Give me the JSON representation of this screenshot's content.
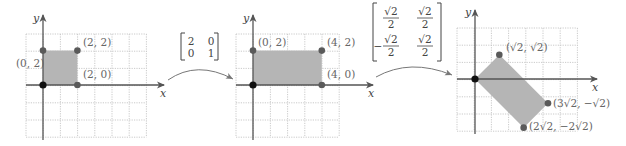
{
  "colors": {
    "grid": "#c4c4c4",
    "axis": "#555555",
    "fill": "#b5b5b5",
    "point": "#5a5a5a",
    "origin": "#111111",
    "arrow": "#777777",
    "text": "#666666"
  },
  "panels": [
    {
      "name": "original-square",
      "grid": {
        "left": 26,
        "top": 34,
        "cols": 7,
        "rows": 6,
        "cell": 17.2
      },
      "origin": [
        43,
        85
      ],
      "x_axis": {
        "from": 26,
        "to": 164,
        "label": "x",
        "label_pos": [
          160,
          97
        ]
      },
      "y_axis": {
        "from": 140,
        "to": 15,
        "label": "y",
        "label_pos": [
          33,
          22
        ]
      },
      "polygon": [
        [
          0,
          0
        ],
        [
          2,
          0
        ],
        [
          2,
          2
        ],
        [
          0,
          2
        ]
      ],
      "unit": 17.2,
      "points": [
        {
          "xy": [
            0,
            0
          ],
          "origin": true
        },
        {
          "xy": [
            2,
            0
          ],
          "label": "(2, 0)",
          "label_pos": [
            83,
            78
          ]
        },
        {
          "xy": [
            2,
            2
          ],
          "label": "(2, 2)",
          "label_pos": [
            83,
            46
          ]
        },
        {
          "xy": [
            0,
            2
          ],
          "label": "(0, 2)",
          "label_pos": [
            16,
            67
          ]
        }
      ]
    },
    {
      "name": "stretched-rectangle",
      "grid": {
        "left": 236,
        "top": 34,
        "cols": 6,
        "rows": 6,
        "cell": 17.2
      },
      "origin": [
        253,
        85
      ],
      "x_axis": {
        "from": 236,
        "to": 373,
        "label": "x",
        "label_pos": [
          368,
          97
        ]
      },
      "y_axis": {
        "from": 140,
        "to": 15,
        "label": "y",
        "label_pos": [
          243,
          22
        ]
      },
      "polygon": [
        [
          0,
          0
        ],
        [
          4,
          0
        ],
        [
          4,
          2
        ],
        [
          0,
          2
        ]
      ],
      "unit": 17.2,
      "points": [
        {
          "xy": [
            0,
            0
          ],
          "origin": true
        },
        {
          "xy": [
            4,
            0
          ],
          "label": "(4, 0)",
          "label_pos": [
            327,
            78
          ]
        },
        {
          "xy": [
            4,
            2
          ],
          "label": "(4, 2)",
          "label_pos": [
            327,
            46
          ]
        },
        {
          "xy": [
            0,
            2
          ],
          "label": "(0, 2)",
          "label_pos": [
            258,
            46
          ]
        }
      ]
    },
    {
      "name": "rotated-rectangle",
      "grid": {
        "left": 457,
        "top": 28,
        "cols": 7,
        "rows": 6,
        "cell": 17.2
      },
      "origin": [
        475,
        79
      ],
      "x_axis": {
        "from": 457,
        "to": 597,
        "label": "x",
        "label_pos": [
          592,
          91
        ]
      },
      "y_axis": {
        "from": 134,
        "to": 10,
        "label": "y",
        "label_pos": [
          465,
          16
        ]
      },
      "polygon": [
        [
          0,
          0
        ],
        [
          1.4142,
          1.4142
        ],
        [
          4.2426,
          -1.4142
        ],
        [
          2.8284,
          -2.8284
        ]
      ],
      "unit": 17.2,
      "points": [
        {
          "xy": [
            0,
            0
          ],
          "origin": true
        },
        {
          "xy": [
            1.4142,
            1.4142
          ],
          "label": "(√2, √2)",
          "label_pos": [
            506,
            51
          ]
        },
        {
          "xy": [
            4.2426,
            -1.4142
          ],
          "label": "(3√2, −√2)",
          "label_pos": [
            553,
            107
          ]
        },
        {
          "xy": [
            2.8284,
            -2.8284
          ],
          "label": "(2√2, −2√2)",
          "label_pos": [
            529,
            130
          ]
        }
      ]
    }
  ],
  "transforms": [
    {
      "name": "scale-matrix",
      "bracket": {
        "left": 181,
        "right": 218,
        "top": 33,
        "bottom": 60
      },
      "entries": [
        {
          "text": "2",
          "pos": [
            191,
            45
          ]
        },
        {
          "text": "0",
          "pos": [
            211,
            45
          ]
        },
        {
          "text": "0",
          "pos": [
            191,
            57
          ]
        },
        {
          "text": "1",
          "pos": [
            211,
            57
          ]
        }
      ],
      "arrow": {
        "start": [
          168,
          80
        ],
        "control": [
          197,
          60
        ],
        "end": [
          233,
          79
        ]
      }
    },
    {
      "name": "rotation-matrix",
      "bracket": {
        "left": 373,
        "right": 441,
        "top": 3,
        "bottom": 61
      },
      "fractions": [
        {
          "num": "√2",
          "den": "2",
          "cx": 391,
          "bar_y": 18,
          "sign": ""
        },
        {
          "num": "√2",
          "den": "2",
          "cx": 425,
          "bar_y": 18,
          "sign": ""
        },
        {
          "num": "√2",
          "den": "2",
          "cx": 391,
          "bar_y": 46,
          "sign": "−"
        },
        {
          "num": "√2",
          "den": "2",
          "cx": 425,
          "bar_y": 46,
          "sign": ""
        }
      ],
      "arrow": {
        "start": [
          376,
          77
        ],
        "control": [
          410,
          58
        ],
        "end": [
          452,
          75
        ]
      }
    }
  ]
}
